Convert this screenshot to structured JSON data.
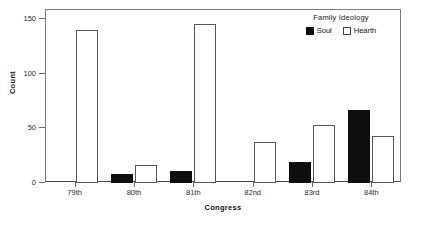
{
  "chart_data": {
    "type": "bar",
    "title": "",
    "xlabel": "Congress",
    "ylabel": "Count",
    "categories": [
      "79th",
      "80th",
      "81th",
      "82nd",
      "83rd",
      "84th"
    ],
    "series": [
      {
        "name": "Soul",
        "values": [
          0,
          8,
          11,
          0,
          19,
          67
        ],
        "color": "#0d0d0d"
      },
      {
        "name": "Hearth",
        "values": [
          140,
          16,
          145,
          37,
          53,
          43
        ],
        "color": "#ffffff"
      }
    ],
    "ylim": [
      0,
      158
    ],
    "yticks": [
      0,
      50,
      100,
      150
    ],
    "ytick_labels": [
      "0",
      "50",
      "100",
      "150"
    ],
    "grid": false,
    "legend": {
      "title": "Family Ideology",
      "position": "top-right-inside",
      "entries": [
        "Soul",
        "Hearth"
      ]
    }
  }
}
